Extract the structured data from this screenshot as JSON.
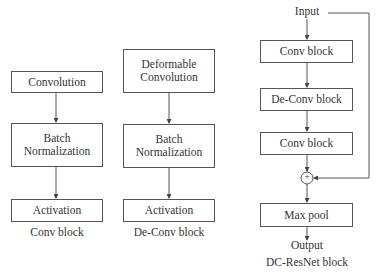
{
  "conv_block": {
    "steps": [
      "Convolution",
      "Batch Normalization",
      "Activation"
    ],
    "caption": "Conv block"
  },
  "deconv_block": {
    "steps": [
      "Deformable Convolution",
      "Batch Normalization",
      "Activation"
    ],
    "caption": "De-Conv block"
  },
  "dcresnet_block": {
    "input": "Input",
    "steps": [
      "Conv block",
      "De-Conv block",
      "Conv block"
    ],
    "add_symbol": "+",
    "pool": "Max pool",
    "output": "Output",
    "caption": "DC-ResNet block"
  }
}
